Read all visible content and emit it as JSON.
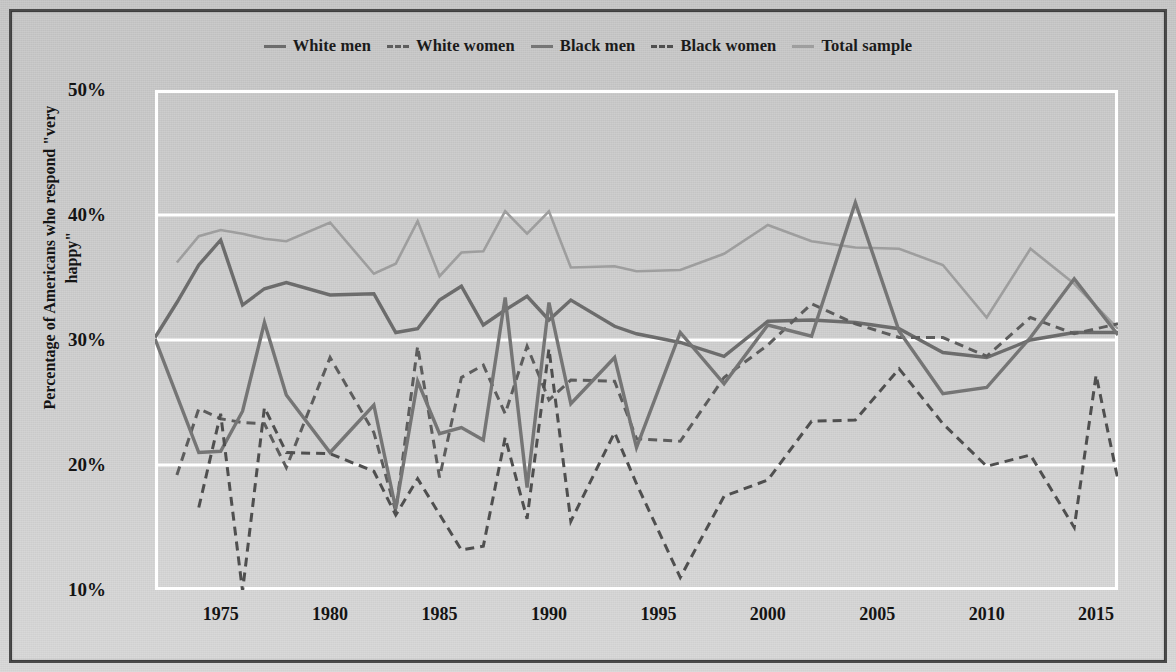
{
  "chart_data": {
    "type": "line",
    "title": "",
    "xlabel": "",
    "ylabel": "Percentage of Americans who respond \"very happy\"",
    "xlim": [
      1972,
      2016
    ],
    "ylim": [
      10,
      50
    ],
    "xticks": [
      1975,
      1980,
      1985,
      1990,
      1995,
      2000,
      2005,
      2010,
      2015
    ],
    "yticks": [
      "10%",
      "20%",
      "30%",
      "40%",
      "50%"
    ],
    "ytick_values": [
      10,
      20,
      30,
      40,
      50
    ],
    "grid": "horizontal",
    "legend_position": "top-center",
    "series": [
      {
        "name": "White men",
        "style": "solid",
        "color": "#6c6c6c",
        "width": 3.4,
        "points": [
          [
            1972,
            30.2
          ],
          [
            1973,
            33.0
          ],
          [
            1974,
            36.0
          ],
          [
            1975,
            38.0
          ],
          [
            1976,
            32.8
          ],
          [
            1977,
            34.1
          ],
          [
            1978,
            34.6
          ],
          [
            1980,
            33.6
          ],
          [
            1982,
            33.7
          ],
          [
            1983,
            30.6
          ],
          [
            1984,
            30.9
          ],
          [
            1985,
            33.2
          ],
          [
            1986,
            34.3
          ],
          [
            1987,
            31.2
          ],
          [
            1988,
            32.4
          ],
          [
            1989,
            33.5
          ],
          [
            1990,
            31.6
          ],
          [
            1991,
            33.2
          ],
          [
            1993,
            31.1
          ],
          [
            1994,
            30.5
          ],
          [
            1996,
            29.8
          ],
          [
            1998,
            28.7
          ],
          [
            2000,
            31.5
          ],
          [
            2002,
            31.6
          ],
          [
            2004,
            31.4
          ],
          [
            2006,
            30.9
          ],
          [
            2008,
            29.0
          ],
          [
            2010,
            28.6
          ],
          [
            2012,
            30.0
          ],
          [
            2014,
            30.6
          ],
          [
            2016,
            30.6
          ]
        ]
      },
      {
        "name": "White women",
        "style": "dashed",
        "color": "#5d5d5d",
        "width": 3.0,
        "points": [
          [
            1973,
            19.2
          ],
          [
            1974,
            24.5
          ],
          [
            1975,
            23.7
          ],
          [
            1976,
            23.4
          ],
          [
            1977,
            23.3
          ],
          [
            1978,
            19.8
          ],
          [
            1980,
            28.6
          ],
          [
            1982,
            22.6
          ],
          [
            1983,
            16.3
          ],
          [
            1984,
            29.5
          ],
          [
            1985,
            19.0
          ],
          [
            1986,
            27.0
          ],
          [
            1987,
            28.0
          ],
          [
            1988,
            24.1
          ],
          [
            1989,
            29.5
          ],
          [
            1990,
            25.2
          ],
          [
            1991,
            26.8
          ],
          [
            1993,
            26.7
          ],
          [
            1994,
            22.1
          ],
          [
            1996,
            21.9
          ],
          [
            1998,
            27.0
          ],
          [
            2000,
            29.6
          ],
          [
            2002,
            32.9
          ],
          [
            2004,
            31.3
          ],
          [
            2006,
            30.2
          ],
          [
            2008,
            30.2
          ],
          [
            2010,
            28.7
          ],
          [
            2012,
            31.8
          ],
          [
            2014,
            30.5
          ],
          [
            2016,
            31.3
          ]
        ]
      },
      {
        "name": "Black men",
        "style": "solid",
        "color": "#757575",
        "width": 3.4,
        "points": [
          [
            1972,
            30.1
          ],
          [
            1974,
            21.0
          ],
          [
            1975,
            21.1
          ],
          [
            1976,
            24.3
          ],
          [
            1977,
            31.4
          ],
          [
            1978,
            25.6
          ],
          [
            1980,
            21.0
          ],
          [
            1982,
            24.8
          ],
          [
            1983,
            16.5
          ],
          [
            1984,
            26.7
          ],
          [
            1985,
            22.5
          ],
          [
            1986,
            23.0
          ],
          [
            1987,
            22.0
          ],
          [
            1988,
            33.4
          ],
          [
            1989,
            18.2
          ],
          [
            1990,
            33.0
          ],
          [
            1991,
            24.9
          ],
          [
            1993,
            28.6
          ],
          [
            1994,
            21.4
          ],
          [
            1996,
            30.6
          ],
          [
            1998,
            26.5
          ],
          [
            2000,
            31.2
          ],
          [
            2002,
            30.3
          ],
          [
            2004,
            41.0
          ],
          [
            2006,
            30.7
          ],
          [
            2008,
            25.7
          ],
          [
            2010,
            26.2
          ],
          [
            2012,
            30.2
          ],
          [
            2014,
            34.9
          ],
          [
            2016,
            30.4
          ]
        ]
      },
      {
        "name": "Black women",
        "style": "dashed",
        "color": "#4f4f4f",
        "width": 3.0,
        "points": [
          [
            1974,
            16.6
          ],
          [
            1975,
            24.1
          ],
          [
            1976,
            9.9
          ],
          [
            1977,
            24.6
          ],
          [
            1978,
            21.0
          ],
          [
            1980,
            20.9
          ],
          [
            1982,
            19.5
          ],
          [
            1983,
            16.0
          ],
          [
            1984,
            18.9
          ],
          [
            1986,
            13.2
          ],
          [
            1987,
            13.5
          ],
          [
            1988,
            22.2
          ],
          [
            1989,
            15.7
          ],
          [
            1990,
            29.3
          ],
          [
            1991,
            15.5
          ],
          [
            1993,
            22.6
          ],
          [
            1994,
            18.5
          ],
          [
            1996,
            11.0
          ],
          [
            1998,
            17.5
          ],
          [
            2000,
            18.8
          ],
          [
            2002,
            23.5
          ],
          [
            2004,
            23.6
          ],
          [
            2006,
            27.7
          ],
          [
            2008,
            23.3
          ],
          [
            2010,
            19.9
          ],
          [
            2012,
            20.8
          ],
          [
            2014,
            15.0
          ],
          [
            2015,
            27.2
          ],
          [
            2016,
            18.8
          ]
        ]
      },
      {
        "name": "Total sample",
        "style": "solid",
        "color": "#9e9e9e",
        "width": 2.6,
        "points": [
          [
            1973,
            36.2
          ],
          [
            1974,
            38.3
          ],
          [
            1975,
            38.8
          ],
          [
            1976,
            38.5
          ],
          [
            1977,
            38.1
          ],
          [
            1978,
            37.9
          ],
          [
            1980,
            39.4
          ],
          [
            1982,
            35.3
          ],
          [
            1983,
            36.1
          ],
          [
            1984,
            39.5
          ],
          [
            1985,
            35.1
          ],
          [
            1986,
            37.0
          ],
          [
            1987,
            37.1
          ],
          [
            1988,
            40.3
          ],
          [
            1989,
            38.5
          ],
          [
            1990,
            40.3
          ],
          [
            1991,
            35.8
          ],
          [
            1993,
            35.9
          ],
          [
            1994,
            35.5
          ],
          [
            1996,
            35.6
          ],
          [
            1998,
            36.9
          ],
          [
            2000,
            39.2
          ],
          [
            2002,
            37.9
          ],
          [
            2004,
            37.4
          ],
          [
            2006,
            37.3
          ],
          [
            2008,
            36.0
          ],
          [
            2010,
            31.8
          ],
          [
            2012,
            37.3
          ],
          [
            2014,
            34.5
          ],
          [
            2016,
            30.9
          ]
        ]
      }
    ]
  },
  "legend": {
    "items": [
      {
        "label": "White men",
        "style": "solid",
        "color": "#6c6c6c"
      },
      {
        "label": "White women",
        "style": "dashed",
        "color": "#5d5d5d"
      },
      {
        "label": "Black men",
        "style": "solid",
        "color": "#757575"
      },
      {
        "label": "Black women",
        "style": "dashed",
        "color": "#4f4f4f"
      },
      {
        "label": "Total sample",
        "style": "solid",
        "color": "#9e9e9e"
      }
    ]
  },
  "axes": {
    "y_label": "Percentage of Americans who respond \"very happy\"",
    "y_ticks": [
      "50%",
      "40%",
      "30%",
      "20%",
      "10%"
    ],
    "x_ticks": [
      "1975",
      "1980",
      "1985",
      "1990",
      "1995",
      "2000",
      "2005",
      "2010",
      "2015"
    ]
  },
  "colors": {
    "background": "#c9c9c9",
    "frame": "#4a4a4a",
    "grid": "#ffffff",
    "text": "#141414"
  }
}
